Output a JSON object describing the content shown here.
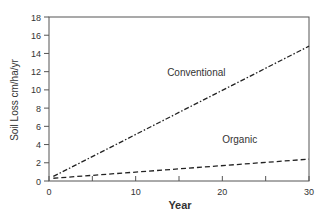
{
  "chart_data": {
    "type": "line",
    "title": "",
    "xlabel": "Year",
    "ylabel": "Soil Loss cm/ha/yr",
    "xlim": [
      0,
      30
    ],
    "ylim": [
      0,
      18
    ],
    "x_ticks": [
      0,
      10,
      20,
      30
    ],
    "x_minor_ticks": [
      5,
      15,
      25
    ],
    "y_ticks": [
      0,
      2,
      4,
      6,
      8,
      10,
      12,
      14,
      16,
      18
    ],
    "grid": false,
    "legend": "inline labels",
    "series": [
      {
        "name": "Conventional",
        "style": "dash-dot",
        "x": [
          0.5,
          30
        ],
        "y": [
          0.5,
          14.8
        ],
        "label_pos": [
          17,
          11.5
        ]
      },
      {
        "name": "Organic",
        "style": "dashed",
        "x": [
          0.5,
          30
        ],
        "y": [
          0.3,
          2.4
        ],
        "label_pos": [
          22,
          4.2
        ]
      }
    ]
  }
}
